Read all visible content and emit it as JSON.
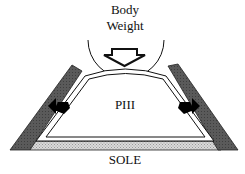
{
  "labels": {
    "force_line1": "Body",
    "force_line2": "Weight",
    "bone": "PIII",
    "sole": "SOLE"
  },
  "colors": {
    "wall": "#5a5a5a",
    "sole_fill": "#cfcfcf",
    "outline": "#111111",
    "background": "#ffffff"
  }
}
